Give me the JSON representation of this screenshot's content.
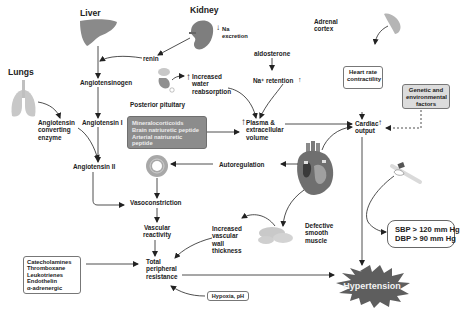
{
  "diagram": {
    "organs": {
      "liver": "Liver",
      "kidney": "Kidney",
      "lungs": "Lungs",
      "adrenal": "Adrenal\ncortex",
      "posterior_pituitary": "Posterior pituitary"
    },
    "nodes": {
      "na_excretion": "Na\nexcretion",
      "renin": "renin",
      "angiotensinogen": "Angiotensinogen",
      "angiotensin_i": "Angiotensin I",
      "angiotensin_ii": "Angiotensin II",
      "ace": "Angiotensin\nconverting\nenzyme",
      "increased_water": "Increased\nwater\nreabsorption",
      "aldosterone": "aldosterone",
      "na_retention": "Na⁺ retention",
      "plasma_volume": "Plasma &\nextracellular\nvolume",
      "heart_rate": "Heart rate\ncontractility",
      "genetic": "Genetic and\nenvironmental\nfactors",
      "cardiac_output": "Cardiac\noutput",
      "autoregulation": "Autoregulation",
      "vasoconstriction": "Vasoconstriction",
      "vascular_reactivity": "Vascular\nreactivity",
      "increased_wall": "Increased\nvascular\nwall\nthickness",
      "defective_muscle": "Defective\nsmooth\nmuscle",
      "total_resistance": "Total\nperipheral\nresistance",
      "hypoxia": "Hypoxia, pH",
      "hypertension": "Hypertension"
    },
    "hormone_box": "Mineralocorticoids\nBrain natriuretic peptide\nArterial natriuretic\npeptide",
    "mediators_box": "Catecholamines\nThromboxane\nLeukotrienes\nEndothelin\nα-adrenergic",
    "bp_box": "SBP > 120 mm Hg\nDBP > 90 mm Hg",
    "indicators": {
      "up_arrow": "↑",
      "down_arrow": "↓"
    },
    "colors": {
      "organ_grey": "#8a8a8a",
      "hormone_box": "#8c8c8c",
      "hypertension_star": "#5e5e5e",
      "line": "#222222"
    }
  }
}
